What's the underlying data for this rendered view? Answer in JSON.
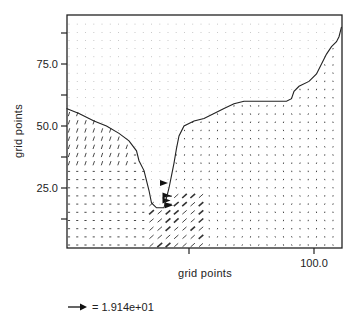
{
  "chart_data": {
    "type": "vector-field",
    "title": "",
    "xlabel": "grid points",
    "ylabel": "grid points",
    "xlim": [
      0,
      111
    ],
    "ylim": [
      0,
      94
    ],
    "x_ticks": [
      {
        "value": 50,
        "label": ""
      },
      {
        "value": 100,
        "label": "100.0"
      }
    ],
    "y_ticks": [
      {
        "value": 12.5,
        "label": ""
      },
      {
        "value": 25,
        "label": "25.0"
      },
      {
        "value": 37.5,
        "label": ""
      },
      {
        "value": 50,
        "label": "50.0"
      },
      {
        "value": 62.5,
        "label": ""
      },
      {
        "value": 75,
        "label": "75.0"
      },
      {
        "value": 87.5,
        "label": ""
      }
    ],
    "grid": false,
    "reference_vector": {
      "label": "= 1.914e+01",
      "magnitude": 19.14
    },
    "coastline": [
      [
        1,
        57
      ],
      [
        6,
        55
      ],
      [
        12,
        52
      ],
      [
        17,
        50
      ],
      [
        22,
        47
      ],
      [
        26,
        44
      ],
      [
        29,
        40
      ],
      [
        30,
        36
      ],
      [
        32,
        32
      ],
      [
        33,
        28
      ],
      [
        34,
        24
      ],
      [
        35,
        19
      ],
      [
        37,
        17
      ],
      [
        40,
        17
      ],
      [
        41,
        21
      ],
      [
        42,
        25
      ],
      [
        43,
        30
      ],
      [
        44,
        35
      ],
      [
        45,
        41
      ],
      [
        46,
        46
      ],
      [
        48,
        50
      ],
      [
        52,
        52
      ],
      [
        56,
        53
      ],
      [
        60,
        55
      ],
      [
        64,
        57
      ],
      [
        68,
        59
      ],
      [
        72,
        60
      ],
      [
        76,
        60
      ],
      [
        82,
        60
      ],
      [
        86,
        60
      ],
      [
        89,
        60
      ],
      [
        91,
        61
      ],
      [
        92,
        64
      ],
      [
        94,
        66
      ],
      [
        98,
        68
      ],
      [
        101,
        71
      ],
      [
        103,
        75
      ],
      [
        105,
        79
      ],
      [
        107,
        82
      ],
      [
        109,
        84
      ],
      [
        110,
        86
      ],
      [
        111,
        90
      ]
    ],
    "vector_regions": [
      {
        "region": "west-coast-shelf",
        "x_range": [
          1,
          26
        ],
        "y_range": [
          35,
          51
        ],
        "direction": "north-northeast",
        "relative_magnitude": "moderate"
      },
      {
        "region": "southwest-basin",
        "x_range": [
          1,
          30
        ],
        "y_range": [
          0,
          33
        ],
        "direction": "east",
        "relative_magnitude": "small"
      },
      {
        "region": "strait-jet",
        "x_range": [
          38,
          43
        ],
        "y_range": [
          17,
          30
        ],
        "direction": "east",
        "relative_magnitude": "large"
      },
      {
        "region": "southeast-outflow",
        "x_range": [
          35,
          58
        ],
        "y_range": [
          0,
          22
        ],
        "direction": "northeast",
        "relative_magnitude": "moderate"
      },
      {
        "region": "eastern-basin",
        "x_range": [
          58,
          111
        ],
        "y_range": [
          0,
          58
        ],
        "direction": "weak-variable",
        "relative_magnitude": "small"
      },
      {
        "region": "land-north",
        "x_range": [
          0,
          111
        ],
        "y_range": [
          58,
          94
        ],
        "direction": "none",
        "relative_magnitude": "zero"
      }
    ]
  }
}
